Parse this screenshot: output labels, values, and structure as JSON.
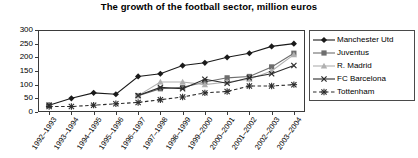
{
  "chart": {
    "title": "The growth of the football sector, million euros"
  },
  "chart_data": {
    "type": "line",
    "title": "The growth of the football sector, million euros",
    "xlabel": "",
    "ylabel": "",
    "ylim": [
      0,
      300
    ],
    "ytick_labels": [
      "300",
      "250",
      "200",
      "150",
      "100",
      "50",
      "0"
    ],
    "yticks": [
      300,
      250,
      200,
      150,
      100,
      50,
      0
    ],
    "grid": false,
    "legend_position": "right",
    "categories": [
      "1992–1993",
      "1993–1994",
      "1994–1995",
      "1995–1996",
      "1996–1997",
      "1997–1998",
      "1998–1999",
      "1999–2000",
      "2000–2001",
      "2001–2002",
      "2002–2003",
      "2003–2004"
    ],
    "series": [
      {
        "name": "Manchester Utd",
        "marker": "diamond",
        "color": "#1a1a1a",
        "dash": "solid",
        "values": [
          25,
          50,
          70,
          65,
          130,
          140,
          170,
          180,
          200,
          215,
          240,
          250
        ]
      },
      {
        "name": "Juventus",
        "marker": "square",
        "color": "#6e6e6e",
        "dash": "solid",
        "values": [
          25,
          null,
          null,
          null,
          60,
          85,
          90,
          110,
          125,
          130,
          165,
          215
        ]
      },
      {
        "name": "R. Madrid",
        "marker": "triangle",
        "color": "#b0b0b0",
        "dash": "solid",
        "values": [
          25,
          null,
          null,
          null,
          60,
          110,
          110,
          100,
          110,
          120,
          150,
          210
        ]
      },
      {
        "name": "FC Barcelona",
        "marker": "x",
        "color": "#2b2b2b",
        "dash": "solid",
        "values": [
          25,
          null,
          null,
          null,
          60,
          90,
          85,
          120,
          105,
          125,
          140,
          170
        ]
      },
      {
        "name": "Tottenham",
        "marker": "star",
        "color": "#2b2b2b",
        "dash": "dashed",
        "values": [
          20,
          20,
          25,
          30,
          35,
          45,
          55,
          70,
          75,
          95,
          95,
          100
        ]
      }
    ]
  },
  "legend": {
    "items": [
      {
        "label": "Manchester Utd"
      },
      {
        "label": "Juventus"
      },
      {
        "label": "R. Madrid"
      },
      {
        "label": "FC Barcelona"
      },
      {
        "label": "Tottenham"
      }
    ]
  }
}
